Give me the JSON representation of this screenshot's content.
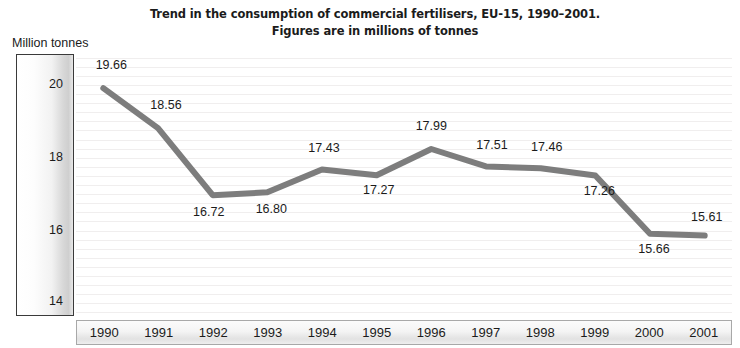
{
  "title": {
    "line1": "Trend in the consumption of commercial fertilisers, EU-15, 1990–2001.",
    "line2": "Figures are in millions of tonnes"
  },
  "y_axis": {
    "caption": "Million tonnes",
    "ticks": [
      "20",
      "18",
      "16",
      "14"
    ]
  },
  "chart_data": {
    "type": "line",
    "title": "Trend in the consumption of commercial fertilisers, EU-15, 1990–2001. Figures are in millions of tonnes",
    "xlabel": "",
    "ylabel": "Million tonnes",
    "categories": [
      "1990",
      "1991",
      "1992",
      "1993",
      "1994",
      "1995",
      "1996",
      "1997",
      "1998",
      "1999",
      "2000",
      "2001"
    ],
    "values": [
      19.66,
      18.56,
      16.72,
      16.8,
      17.43,
      17.27,
      17.99,
      17.51,
      17.46,
      17.26,
      15.66,
      15.61
    ],
    "point_labels": [
      "19.66",
      "18.56",
      "16.72",
      "16.80",
      "17.43",
      "17.27",
      "17.99",
      "17.51",
      "17.46",
      "17.26",
      "15.66",
      "15.61"
    ],
    "yticks": [
      20,
      18,
      16,
      14
    ],
    "ylim": [
      13.4,
      20.6
    ],
    "grid": true,
    "legend": "none",
    "series_color": "#7d7d7d",
    "line_width": 6
  }
}
